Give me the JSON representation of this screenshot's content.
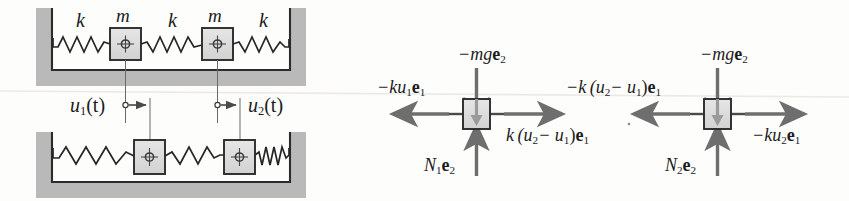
{
  "figure": {
    "ink_color": "#1c1c1c",
    "hatch_color": "#b5b5b5",
    "block_fill": "#dcdcdc",
    "arrow_color": "#6e6e6e",
    "background": "#fdfdfc"
  },
  "left_panel": {
    "name": "mass-spring-schematic",
    "top_system": {
      "spring_labels": [
        "k",
        "k",
        "k"
      ],
      "mass_labels": [
        "m",
        "m"
      ],
      "springs": 3,
      "masses": 2,
      "state": "undeformed reference configuration"
    },
    "bottom_system": {
      "springs": 3,
      "masses": 2,
      "state": "displaced configuration"
    },
    "displacements": [
      {
        "label_main": "u",
        "label_sub": "1",
        "label_arg": "(t)",
        "text": "u1(t)"
      },
      {
        "label_main": "u",
        "label_sub": "2",
        "label_arg": "(t)",
        "text": "u2(t)"
      }
    ]
  },
  "right_panel": {
    "name": "free-body-diagrams",
    "bodies": [
      {
        "name": "free-body-diagram-mass-1",
        "forces": [
          {
            "name": "gravity-force-1",
            "direction": "down",
            "coef": "−mg",
            "basis": "e",
            "basis_sub": "2"
          },
          {
            "name": "normal-force-1",
            "direction": "up",
            "coef": "N",
            "coef_sub": "1",
            "basis": "e",
            "basis_sub": "2"
          },
          {
            "name": "left-spring-force-1",
            "direction": "left",
            "coef": "−ku",
            "coef_sub": "1",
            "basis": "e",
            "basis_sub": "1"
          },
          {
            "name": "coupling-spring-force-1",
            "direction": "right",
            "coef": "k(u2−u1)",
            "basis": "e",
            "basis_sub": "1"
          }
        ]
      },
      {
        "name": "free-body-diagram-mass-2",
        "forces": [
          {
            "name": "gravity-force-2",
            "direction": "down",
            "coef": "−mg",
            "basis": "e",
            "basis_sub": "2"
          },
          {
            "name": "normal-force-2",
            "direction": "up",
            "coef": "N",
            "coef_sub": "2",
            "basis": "e",
            "basis_sub": "2"
          },
          {
            "name": "coupling-spring-force-2",
            "direction": "left",
            "coef": "−k(u2−u1)",
            "basis": "e",
            "basis_sub": "1"
          },
          {
            "name": "right-spring-force-2",
            "direction": "right",
            "coef": "−ku",
            "coef_sub": "2",
            "basis": "e",
            "basis_sub": "1"
          }
        ]
      }
    ]
  },
  "labels": {
    "k_left": "k",
    "k_middle": "k",
    "k_right": "k",
    "m_left": "m",
    "m_right": "m",
    "u1": "u",
    "u1_sub": "1",
    "u1_tail": "(t)",
    "u2": "u",
    "u2_sub": "2",
    "u2_tail": "(t)",
    "mg1_coef": "−mg",
    "mg1_basis": "e",
    "mg1_basis_sub": "2",
    "mg2_coef": "−mg",
    "mg2_basis": "e",
    "mg2_basis_sub": "2",
    "n1_coef": "N",
    "n1_coef_sub": "1",
    "n1_basis": "e",
    "n1_basis_sub": "2",
    "n2_coef": "N",
    "n2_coef_sub": "2",
    "n2_basis": "e",
    "n2_basis_sub": "2",
    "ku1_pre": "−ku",
    "ku1_sub": "1",
    "ku1_basis": "e",
    "ku1_basis_sub": "1",
    "ku2_pre": "−ku",
    "ku2_sub": "2",
    "ku2_basis": "e",
    "ku2_basis_sub": "1",
    "coupling_pos_pre": "k (u",
    "coupling_pos_sub1": "2",
    "coupling_pos_mid": "− u",
    "coupling_pos_sub2": "1",
    "coupling_pos_close": ")",
    "coupling_pos_basis": "e",
    "coupling_pos_basis_sub": "1",
    "coupling_neg_pre": "−k (u",
    "coupling_neg_sub1": "2",
    "coupling_neg_mid": "− u",
    "coupling_neg_sub2": "1",
    "coupling_neg_close": ")",
    "coupling_neg_basis": "e",
    "coupling_neg_basis_sub": "1"
  }
}
